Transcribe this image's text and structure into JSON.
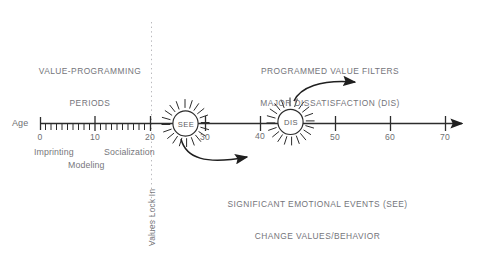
{
  "figure": {
    "title_left": {
      "line1": "VALUE-PROGRAMMING",
      "line2": "PERIODS"
    },
    "title_right": {
      "line1": "PROGRAMMED VALUE FILTERS",
      "line2": "MAJOR DISSATISFACTION (DIS)"
    },
    "caption_bottom": {
      "line1": "SIGNIFICANT EMOTIONAL EVENTS (SEE)",
      "line2": "CHANGE VALUES/BEHAVIOR"
    },
    "vertical_label": "Values Lock In",
    "axis": {
      "name": "Age",
      "ticks": [
        "0",
        "10",
        "20",
        "30",
        "40",
        "50",
        "60",
        "70"
      ],
      "tick_values": [
        0,
        10,
        20,
        30,
        40,
        50,
        60,
        70
      ],
      "minor_tick_range": [
        0,
        20
      ],
      "minor_tick_step": 1
    },
    "stages": [
      {
        "label": "Imprinting",
        "age": 2
      },
      {
        "label": "Socialization",
        "age": 14
      },
      {
        "label": "Modeling",
        "age": 8
      }
    ],
    "events": [
      {
        "id": "see",
        "label": "SEE",
        "age": 26,
        "shape": "starburst"
      },
      {
        "id": "dis",
        "label": "DIS",
        "age": 45,
        "shape": "starburst"
      }
    ],
    "lock_in_age": 20,
    "colors": {
      "background": "#ffffff",
      "line": "#2c2c2c",
      "text": "#6f6f73",
      "burst_text": "#5d5d62",
      "dotted_guide": "#b9b9bd"
    }
  }
}
